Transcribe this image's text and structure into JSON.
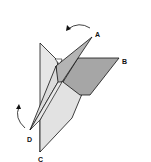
{
  "diagram": {
    "type": "origami-fold-step",
    "labels": {
      "a": "A",
      "b": "B",
      "c": "C",
      "d": "D"
    },
    "arrows": [
      {
        "name": "fold-arrow-a",
        "direction": "counterclockwise",
        "near": "A"
      },
      {
        "name": "fold-arrow-d",
        "direction": "up",
        "near": "D"
      }
    ],
    "colors": {
      "light_paper": "#e2e2e2",
      "mid_paper": "#d0d0d0",
      "dark_paper": "#a9a9a9",
      "outline": "#111111"
    }
  }
}
